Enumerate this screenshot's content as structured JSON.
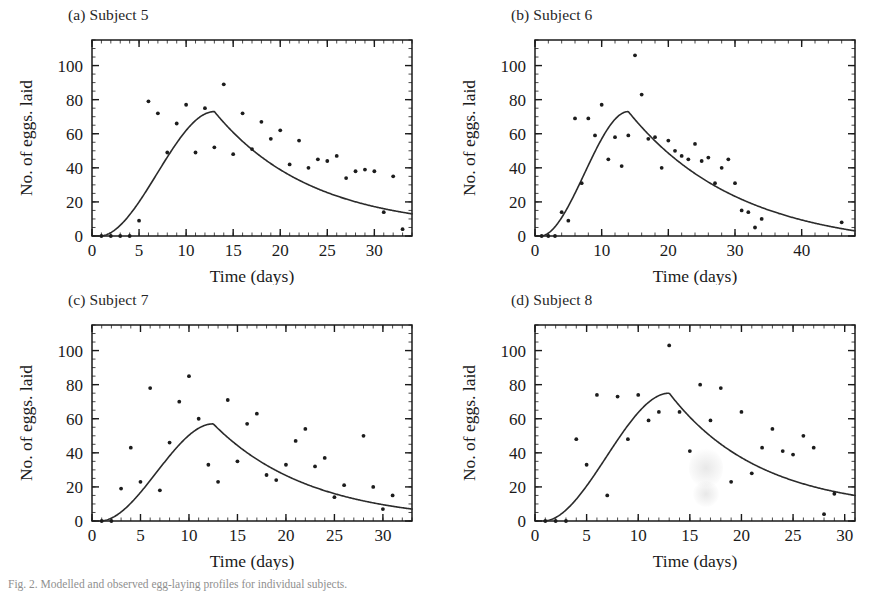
{
  "figure": {
    "caption": "Fig. 2. Modelled and observed egg-laying profiles for individual subjects.",
    "axis_titles": {
      "x": "Time (days)",
      "y": "No. of eggs. laid"
    },
    "colors": {
      "ink": "#1a1a1a",
      "curve": "#2b2b2b",
      "point": "#1c1c1c",
      "background": "#ffffff"
    }
  },
  "chart_data": [
    {
      "type": "scatter",
      "panel": "a",
      "title": "(a) Subject 5",
      "xlabel": "Time (days)",
      "ylabel": "No. of eggs. laid",
      "xlim": [
        0,
        34
      ],
      "ylim": [
        0,
        115
      ],
      "xticks": [
        0,
        5,
        10,
        15,
        20,
        25,
        30
      ],
      "yticks": [
        0,
        20,
        40,
        60,
        80,
        100
      ],
      "minor_tick_step_x": 1,
      "minor_tick_step_y": 5,
      "grid": false,
      "legend": "none",
      "points": [
        [
          1,
          0
        ],
        [
          2,
          0
        ],
        [
          3,
          0
        ],
        [
          4,
          0
        ],
        [
          5,
          9
        ],
        [
          6,
          79
        ],
        [
          7,
          72
        ],
        [
          8,
          49
        ],
        [
          9,
          66
        ],
        [
          10,
          77
        ],
        [
          11,
          49
        ],
        [
          12,
          75
        ],
        [
          13,
          52
        ],
        [
          14,
          89
        ],
        [
          15,
          48
        ],
        [
          16,
          72
        ],
        [
          17,
          51
        ],
        [
          18,
          67
        ],
        [
          19,
          57
        ],
        [
          20,
          62
        ],
        [
          21,
          42
        ],
        [
          22,
          56
        ],
        [
          23,
          40
        ],
        [
          24,
          45
        ],
        [
          25,
          44
        ],
        [
          26,
          47
        ],
        [
          27,
          34
        ],
        [
          28,
          38
        ],
        [
          29,
          39
        ],
        [
          30,
          38
        ],
        [
          31,
          14
        ],
        [
          32,
          35
        ],
        [
          33,
          4
        ]
      ],
      "curve": {
        "description": "fitted unimodal egg-laying rate curve",
        "peak_x": 13,
        "peak_y": 73,
        "start_x": 0.8,
        "end_x": 34,
        "end_y": 13
      }
    },
    {
      "type": "scatter",
      "panel": "b",
      "title": "(b) Subject 6",
      "xlabel": "Time (days)",
      "ylabel": "No. of eggs. laid",
      "xlim": [
        0,
        48
      ],
      "ylim": [
        0,
        115
      ],
      "xticks": [
        0,
        10,
        20,
        30,
        40
      ],
      "yticks": [
        0,
        20,
        40,
        60,
        80,
        100
      ],
      "minor_tick_step_x": 2,
      "minor_tick_step_y": 5,
      "grid": false,
      "legend": "none",
      "points": [
        [
          1,
          0
        ],
        [
          2,
          0
        ],
        [
          3,
          0
        ],
        [
          4,
          14
        ],
        [
          5,
          9
        ],
        [
          6,
          69
        ],
        [
          7,
          31
        ],
        [
          8,
          69
        ],
        [
          9,
          59
        ],
        [
          10,
          77
        ],
        [
          11,
          45
        ],
        [
          12,
          58
        ],
        [
          13,
          41
        ],
        [
          14,
          59
        ],
        [
          15,
          106
        ],
        [
          16,
          83
        ],
        [
          17,
          57
        ],
        [
          18,
          58
        ],
        [
          19,
          40
        ],
        [
          20,
          56
        ],
        [
          21,
          50
        ],
        [
          22,
          47
        ],
        [
          23,
          45
        ],
        [
          24,
          54
        ],
        [
          25,
          44
        ],
        [
          26,
          46
        ],
        [
          27,
          31
        ],
        [
          28,
          40
        ],
        [
          29,
          45
        ],
        [
          30,
          31
        ],
        [
          31,
          15
        ],
        [
          32,
          14
        ],
        [
          33,
          5
        ],
        [
          34,
          10
        ],
        [
          46,
          8
        ]
      ],
      "curve": {
        "description": "fitted unimodal egg-laying rate curve",
        "peak_x": 14,
        "peak_y": 73,
        "start_x": 0.8,
        "end_x": 48,
        "end_y": 3
      }
    },
    {
      "type": "scatter",
      "panel": "c",
      "title": "(c) Subject 7",
      "xlabel": "Time (days)",
      "ylabel": "No. of eggs. laid",
      "xlim": [
        0,
        33
      ],
      "ylim": [
        0,
        115
      ],
      "xticks": [
        0,
        5,
        10,
        15,
        20,
        25,
        30
      ],
      "yticks": [
        0,
        20,
        40,
        60,
        80,
        100
      ],
      "minor_tick_step_x": 1,
      "minor_tick_step_y": 5,
      "grid": false,
      "legend": "none",
      "points": [
        [
          1,
          0
        ],
        [
          2,
          0
        ],
        [
          3,
          19
        ],
        [
          4,
          43
        ],
        [
          5,
          23
        ],
        [
          6,
          78
        ],
        [
          7,
          18
        ],
        [
          8,
          46
        ],
        [
          9,
          70
        ],
        [
          10,
          85
        ],
        [
          11,
          60
        ],
        [
          12,
          33
        ],
        [
          13,
          23
        ],
        [
          14,
          71
        ],
        [
          15,
          35
        ],
        [
          16,
          57
        ],
        [
          17,
          63
        ],
        [
          18,
          27
        ],
        [
          19,
          24
        ],
        [
          20,
          33
        ],
        [
          21,
          47
        ],
        [
          22,
          54
        ],
        [
          23,
          32
        ],
        [
          24,
          37
        ],
        [
          25,
          14
        ],
        [
          26,
          21
        ],
        [
          28,
          50
        ],
        [
          29,
          20
        ],
        [
          30,
          7
        ],
        [
          31,
          15
        ]
      ],
      "curve": {
        "description": "fitted unimodal egg-laying rate curve",
        "peak_x": 12.5,
        "peak_y": 57,
        "start_x": 0.8,
        "end_x": 33,
        "end_y": 7
      }
    },
    {
      "type": "scatter",
      "panel": "d",
      "title": "(d) Subject 8",
      "xlabel": "Time (days)",
      "ylabel": "No. of eggs. laid",
      "xlim": [
        0,
        31
      ],
      "ylim": [
        0,
        115
      ],
      "xticks": [
        0,
        5,
        10,
        15,
        20,
        25,
        30
      ],
      "yticks": [
        0,
        20,
        40,
        60,
        80,
        100
      ],
      "minor_tick_step_x": 1,
      "minor_tick_step_y": 5,
      "grid": false,
      "legend": "none",
      "points": [
        [
          1,
          0
        ],
        [
          2,
          0
        ],
        [
          3,
          0
        ],
        [
          4,
          48
        ],
        [
          5,
          33
        ],
        [
          6,
          74
        ],
        [
          7,
          15
        ],
        [
          8,
          73
        ],
        [
          9,
          48
        ],
        [
          10,
          74
        ],
        [
          11,
          59
        ],
        [
          12,
          64
        ],
        [
          13,
          103
        ],
        [
          14,
          64
        ],
        [
          15,
          41
        ],
        [
          16,
          80
        ],
        [
          17,
          59
        ],
        [
          18,
          78
        ],
        [
          19,
          23
        ],
        [
          20,
          64
        ],
        [
          21,
          28
        ],
        [
          22,
          43
        ],
        [
          23,
          54
        ],
        [
          24,
          41
        ],
        [
          25,
          39
        ],
        [
          26,
          50
        ],
        [
          27,
          43
        ],
        [
          28,
          4
        ],
        [
          29,
          16
        ]
      ],
      "curve": {
        "description": "fitted unimodal egg-laying rate curve",
        "peak_x": 13,
        "peak_y": 75,
        "start_x": 0.8,
        "end_x": 31,
        "end_y": 15
      }
    }
  ]
}
